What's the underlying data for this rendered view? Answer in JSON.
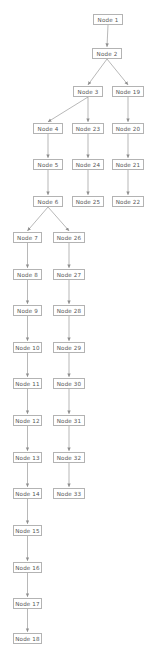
{
  "diagram": {
    "type": "flowchart-tree",
    "orientation": "top-to-bottom",
    "node_style": {
      "shape": "rectangle",
      "fill": "#ffffff",
      "border_color": "#b3b3b3",
      "text_color": "#555555"
    },
    "edge_style": {
      "color": "#9a9a9a",
      "arrowhead": "filled-triangle"
    },
    "nodes": [
      {
        "id": "n1",
        "label": "Node 1",
        "x": 93,
        "y": 14,
        "w": 30
      },
      {
        "id": "n2",
        "label": "Node 2",
        "x": 92,
        "y": 48,
        "w": 30
      },
      {
        "id": "n3",
        "label": "Node 3",
        "x": 73,
        "y": 86,
        "w": 30
      },
      {
        "id": "n19",
        "label": "Node 19",
        "x": 112,
        "y": 86,
        "w": 32
      },
      {
        "id": "n4",
        "label": "Node 4",
        "x": 33,
        "y": 123,
        "w": 30
      },
      {
        "id": "n23",
        "label": "Node 23",
        "x": 72,
        "y": 123,
        "w": 32
      },
      {
        "id": "n20",
        "label": "Node 20",
        "x": 112,
        "y": 123,
        "w": 32
      },
      {
        "id": "n5",
        "label": "Node 5",
        "x": 33,
        "y": 159,
        "w": 30
      },
      {
        "id": "n24",
        "label": "Node 24",
        "x": 72,
        "y": 159,
        "w": 32
      },
      {
        "id": "n21",
        "label": "Node 21",
        "x": 112,
        "y": 159,
        "w": 32
      },
      {
        "id": "n6",
        "label": "Node 6",
        "x": 33,
        "y": 196,
        "w": 30
      },
      {
        "id": "n25",
        "label": "Node 25",
        "x": 72,
        "y": 196,
        "w": 32
      },
      {
        "id": "n22",
        "label": "Node 22",
        "x": 112,
        "y": 196,
        "w": 32
      },
      {
        "id": "n7",
        "label": "Node 7",
        "x": 13,
        "y": 232,
        "w": 29
      },
      {
        "id": "n26",
        "label": "Node 26",
        "x": 53,
        "y": 232,
        "w": 32
      },
      {
        "id": "n8",
        "label": "Node 8",
        "x": 13,
        "y": 269,
        "w": 29
      },
      {
        "id": "n27",
        "label": "Node 27",
        "x": 53,
        "y": 269,
        "w": 32
      },
      {
        "id": "n9",
        "label": "Node 9",
        "x": 13,
        "y": 305,
        "w": 29
      },
      {
        "id": "n28",
        "label": "Node 28",
        "x": 53,
        "y": 305,
        "w": 32
      },
      {
        "id": "n10",
        "label": "Node 10",
        "x": 13,
        "y": 342,
        "w": 29
      },
      {
        "id": "n29",
        "label": "Node 29",
        "x": 53,
        "y": 342,
        "w": 32
      },
      {
        "id": "n11",
        "label": "Node 11",
        "x": 13,
        "y": 378,
        "w": 29
      },
      {
        "id": "n30",
        "label": "Node 30",
        "x": 53,
        "y": 378,
        "w": 32
      },
      {
        "id": "n12",
        "label": "Node 12",
        "x": 13,
        "y": 415,
        "w": 29
      },
      {
        "id": "n31",
        "label": "Node 31",
        "x": 53,
        "y": 415,
        "w": 32
      },
      {
        "id": "n13",
        "label": "Node 13",
        "x": 13,
        "y": 452,
        "w": 29
      },
      {
        "id": "n32",
        "label": "Node 32",
        "x": 53,
        "y": 452,
        "w": 32
      },
      {
        "id": "n14",
        "label": "Node 14",
        "x": 13,
        "y": 488,
        "w": 29
      },
      {
        "id": "n33",
        "label": "Node 33",
        "x": 53,
        "y": 488,
        "w": 32
      },
      {
        "id": "n15",
        "label": "Node 15",
        "x": 13,
        "y": 525,
        "w": 29
      },
      {
        "id": "n16",
        "label": "Node 16",
        "x": 13,
        "y": 562,
        "w": 29
      },
      {
        "id": "n17",
        "label": "Node 17",
        "x": 13,
        "y": 598,
        "w": 29
      },
      {
        "id": "n18",
        "label": "Node 18",
        "x": 13,
        "y": 633,
        "w": 29
      }
    ],
    "edges": [
      {
        "from": "n1",
        "to": "n2"
      },
      {
        "from": "n2",
        "to": "n3"
      },
      {
        "from": "n2",
        "to": "n19"
      },
      {
        "from": "n3",
        "to": "n4"
      },
      {
        "from": "n3",
        "to": "n23"
      },
      {
        "from": "n19",
        "to": "n20"
      },
      {
        "from": "n4",
        "to": "n5"
      },
      {
        "from": "n23",
        "to": "n24"
      },
      {
        "from": "n20",
        "to": "n21"
      },
      {
        "from": "n5",
        "to": "n6"
      },
      {
        "from": "n24",
        "to": "n25"
      },
      {
        "from": "n21",
        "to": "n22"
      },
      {
        "from": "n6",
        "to": "n7"
      },
      {
        "from": "n6",
        "to": "n26"
      },
      {
        "from": "n7",
        "to": "n8"
      },
      {
        "from": "n26",
        "to": "n27"
      },
      {
        "from": "n8",
        "to": "n9"
      },
      {
        "from": "n27",
        "to": "n28"
      },
      {
        "from": "n9",
        "to": "n10"
      },
      {
        "from": "n28",
        "to": "n29"
      },
      {
        "from": "n10",
        "to": "n11"
      },
      {
        "from": "n29",
        "to": "n30"
      },
      {
        "from": "n11",
        "to": "n12"
      },
      {
        "from": "n30",
        "to": "n31"
      },
      {
        "from": "n12",
        "to": "n13"
      },
      {
        "from": "n31",
        "to": "n32"
      },
      {
        "from": "n13",
        "to": "n14"
      },
      {
        "from": "n32",
        "to": "n33"
      },
      {
        "from": "n14",
        "to": "n15"
      },
      {
        "from": "n15",
        "to": "n16"
      },
      {
        "from": "n16",
        "to": "n17"
      },
      {
        "from": "n17",
        "to": "n18"
      }
    ]
  }
}
